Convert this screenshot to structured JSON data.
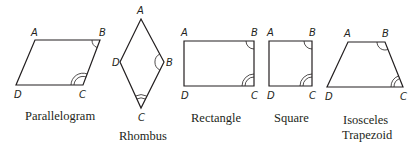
{
  "figure": {
    "shapes": [
      {
        "name": "Parallelogram",
        "caption_lines": [
          "Parallelogram"
        ],
        "vertices": {
          "A": [
            35,
            40
          ],
          "B": [
            100,
            40
          ],
          "C": [
            83,
            85
          ],
          "D": [
            16,
            85
          ]
        },
        "labels": {
          "A": "A",
          "B": "B",
          "C": "C",
          "D": "D"
        },
        "angle_marks": {
          "B": 1,
          "C": 2
        }
      },
      {
        "name": "Rhombus",
        "caption_lines": [
          "Rhombus"
        ],
        "vertices": {
          "A": [
            141,
            19
          ],
          "B": [
            164,
            62
          ],
          "C": [
            141,
            108
          ],
          "D": [
            120,
            62
          ]
        },
        "labels": {
          "A": "A",
          "B": "B",
          "C": "C",
          "D": "D"
        },
        "angle_marks": {
          "B": 1,
          "C": 2
        }
      },
      {
        "name": "Rectangle",
        "caption_lines": [
          "Rectangle"
        ],
        "vertices": {
          "A": [
            184,
            41
          ],
          "B": [
            254,
            41
          ],
          "C": [
            254,
            86
          ],
          "D": [
            184,
            86
          ]
        },
        "labels": {
          "A": "A",
          "B": "B",
          "C": "C",
          "D": "D"
        },
        "angle_marks": {
          "B": 1,
          "C": 2
        }
      },
      {
        "name": "Square",
        "caption_lines": [
          "Square"
        ],
        "vertices": {
          "A": [
            269,
            41
          ],
          "B": [
            312,
            41
          ],
          "C": [
            312,
            86
          ],
          "D": [
            269,
            86
          ]
        },
        "labels": {
          "A": "A",
          "B": "B",
          "C": "C",
          "D": "D"
        },
        "angle_marks": {
          "B": 1,
          "C": 2
        }
      },
      {
        "name": "Isosceles Trapezoid",
        "caption_lines": [
          "Isosceles",
          "Trapezoid"
        ],
        "vertices": {
          "A": [
            348,
            42
          ],
          "B": [
            385,
            42
          ],
          "C": [
            403,
            87
          ],
          "D": [
            327,
            87
          ]
        },
        "labels": {
          "A": "A",
          "B": "B",
          "C": "C",
          "D": "D"
        },
        "angle_marks": {
          "B": 1,
          "C": 2
        }
      }
    ]
  }
}
